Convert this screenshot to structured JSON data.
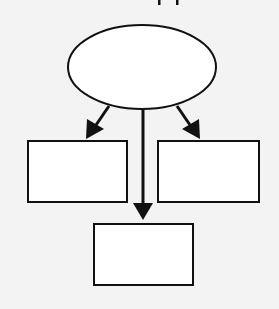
{
  "diagram": {
    "title_fragment": "",
    "colors": {
      "background": "#f3f3f3",
      "stroke": "#111111",
      "fill": "#ffffff"
    },
    "nodes": [
      {
        "id": "root",
        "shape": "ellipse",
        "label": "",
        "cx": 142,
        "cy": 67,
        "rx": 74,
        "ry": 42
      },
      {
        "id": "left",
        "shape": "rect",
        "label": "",
        "x": 28,
        "y": 141,
        "w": 99,
        "h": 61
      },
      {
        "id": "right",
        "shape": "rect",
        "label": "",
        "x": 158,
        "y": 141,
        "w": 101,
        "h": 61
      },
      {
        "id": "bottom",
        "shape": "rect",
        "label": "",
        "x": 94,
        "y": 224,
        "w": 99,
        "h": 61
      }
    ],
    "edges": [
      {
        "from": "root",
        "to": "left"
      },
      {
        "from": "root",
        "to": "right"
      },
      {
        "from": "root",
        "to": "bottom"
      }
    ]
  }
}
